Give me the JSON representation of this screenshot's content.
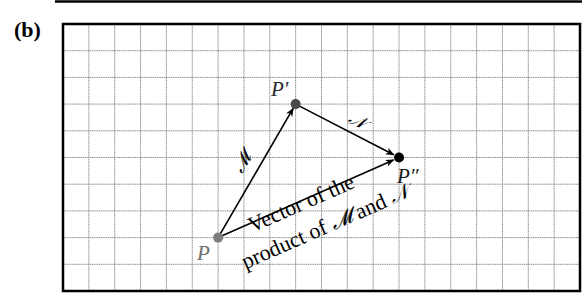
{
  "panel": {
    "label": "(b)"
  },
  "grid": {
    "cols": 20,
    "rows": 10,
    "left": 63,
    "top": 24,
    "right": 580,
    "bottom": 291,
    "line_color": "#8a8a8a",
    "border_color": "#000000"
  },
  "points": {
    "P": {
      "label": "P",
      "col": 6,
      "row": 8,
      "color": "#7d7d7d",
      "label_color": "#6e6e6e"
    },
    "P1": {
      "label": "P′",
      "col": 9,
      "row": 3,
      "color": "#4a4a4a",
      "label_color": "#2a2a2a"
    },
    "P2": {
      "label": "P″",
      "col": 13,
      "row": 5,
      "color": "#000000",
      "label_color": "#1a1a1a"
    }
  },
  "vectors": {
    "M": {
      "label": "𝓜",
      "from": "P",
      "to": "P1"
    },
    "N": {
      "label": "𝒩",
      "from": "P1",
      "to": "P2"
    },
    "product": {
      "from": "P",
      "to": "P2",
      "caption_line1": "Vector of the",
      "caption_line2_pre": "product of ",
      "caption_line2_m": "𝓜",
      "caption_line2_mid": " and ",
      "caption_line2_n": "𝒩"
    }
  }
}
